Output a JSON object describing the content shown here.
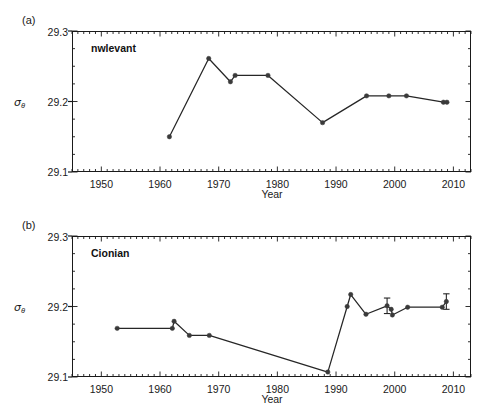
{
  "figure": {
    "xlabel": "Year",
    "ylabel_symbol": "σ",
    "ylabel_sub": "θ",
    "ytick_labels": [
      "29.1",
      "29.2",
      "29.3"
    ],
    "xtick_labels": [
      "1950",
      "1960",
      "1970",
      "1980",
      "1990",
      "2000",
      "2010"
    ],
    "line_color": "#262626",
    "marker_color": "#3a3a3a",
    "axis_color": "#1a1a1a"
  },
  "panels": [
    {
      "tag": "(a)",
      "label": "nwlevant"
    },
    {
      "tag": "(b)",
      "label": "Cionian"
    }
  ],
  "chart_data": [
    {
      "type": "line",
      "title": "nwlevant",
      "panel": "(a)",
      "xlabel": "Year",
      "ylabel": "σθ",
      "xlim": [
        1945,
        2013
      ],
      "ylim": [
        29.1,
        29.3
      ],
      "yticks": [
        29.1,
        29.2,
        29.3
      ],
      "xticks": [
        1950,
        1960,
        1970,
        1980,
        1990,
        2000,
        2010
      ],
      "grid": false,
      "legend": "none",
      "minor_tick_interval": 1,
      "x": [
        1961.6,
        1968.3,
        1972.0,
        1972.8,
        1978.4,
        1987.7,
        1995.2,
        1999.0,
        2002.0,
        2008.3,
        2008.9
      ],
      "y": [
        29.15,
        29.261,
        29.228,
        29.237,
        29.237,
        29.17,
        29.208,
        29.208,
        29.208,
        29.199,
        29.199
      ],
      "yerr": [
        0,
        0,
        0,
        0,
        0,
        0,
        0,
        0,
        0,
        0,
        0
      ]
    },
    {
      "type": "line",
      "title": "Cionian",
      "panel": "(b)",
      "xlabel": "Year",
      "ylabel": "σθ",
      "xlim": [
        1945,
        2013
      ],
      "ylim": [
        29.1,
        29.3
      ],
      "yticks": [
        29.1,
        29.2,
        29.3
      ],
      "xticks": [
        1950,
        1960,
        1970,
        1980,
        1990,
        2000,
        2010
      ],
      "grid": false,
      "legend": "none",
      "minor_tick_interval": 1,
      "x": [
        1952.7,
        1962.1,
        1962.4,
        1965.0,
        1968.4,
        1988.6,
        1991.9,
        1992.5,
        1995.1,
        1998.7,
        1999.4,
        1999.6,
        2002.2,
        2008.1,
        2008.8
      ],
      "y": [
        29.169,
        29.169,
        29.179,
        29.159,
        29.159,
        29.107,
        29.2,
        29.217,
        29.189,
        29.201,
        29.196,
        29.188,
        29.199,
        29.199,
        29.207
      ],
      "yerr": [
        0,
        0,
        0,
        0,
        0,
        0,
        0,
        0,
        0,
        0.011,
        0,
        0,
        0,
        0,
        0.011
      ]
    }
  ]
}
